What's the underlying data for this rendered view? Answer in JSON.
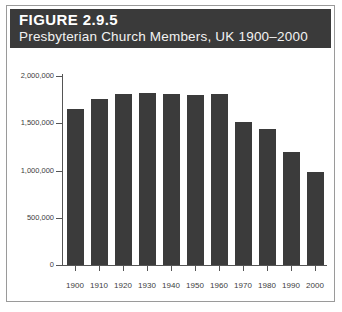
{
  "figure": {
    "number_label": "FIGURE 2.9.5",
    "subtitle": "Presbyterian Church Members, UK 1900–2000"
  },
  "colors": {
    "header_band": "#3a3a3a",
    "bar_fill": "#3b3b3b",
    "axis": "#555555",
    "frame": "#9a9a9a",
    "background": "#ffffff",
    "tick_text": "#3d3d3d"
  },
  "chart_data": {
    "type": "bar",
    "title": "Presbyterian Church Members, UK 1900–2000",
    "xlabel": "",
    "ylabel": "",
    "categories": [
      "1900",
      "1910",
      "1920",
      "1930",
      "1940",
      "1950",
      "1960",
      "1970",
      "1980",
      "1990",
      "2000"
    ],
    "values": [
      1650000,
      1760000,
      1810000,
      1820000,
      1810000,
      1800000,
      1810000,
      1510000,
      1440000,
      1200000,
      980000
    ],
    "ylim": [
      0,
      2000000
    ],
    "ytick_values": [
      0,
      500000,
      1000000,
      1500000,
      2000000
    ],
    "ytick_labels": [
      "0",
      "500,000",
      "1,000,000",
      "1,500,000",
      "2,000,000"
    ],
    "grid": false,
    "legend": null,
    "series": [
      {
        "name": "Presbyterian Church Members",
        "values": [
          1650000,
          1760000,
          1810000,
          1820000,
          1810000,
          1800000,
          1810000,
          1510000,
          1440000,
          1200000,
          980000
        ]
      }
    ]
  }
}
